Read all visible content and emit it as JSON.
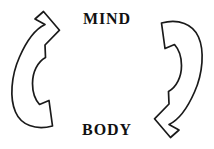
{
  "diagram": {
    "title_top": "MIND",
    "title_bottom": "BODY",
    "colors": {
      "stroke": "#1a1a1a",
      "fill": "#ffffff",
      "background": "#ffffff",
      "text": "#111111"
    },
    "nodes": [
      {
        "id": "mind",
        "label": "MIND",
        "position": "top-center"
      },
      {
        "id": "body",
        "label": "BODY",
        "position": "bottom-center"
      }
    ],
    "arrows": [
      {
        "id": "body-to-mind",
        "icon": "curved-arrow-up-icon",
        "side": "left",
        "direction": "upward",
        "from": "BODY",
        "to": "MIND",
        "head_position": "top"
      },
      {
        "id": "mind-to-body",
        "icon": "curved-arrow-down-icon",
        "side": "right",
        "direction": "downward",
        "from": "MIND",
        "to": "BODY",
        "head_position": "bottom"
      }
    ],
    "relationship": "bidirectional-cycle"
  }
}
